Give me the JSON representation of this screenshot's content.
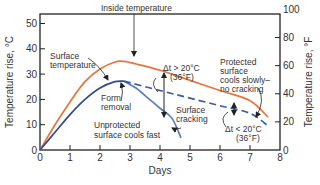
{
  "chart_data": {
    "type": "line",
    "title": "",
    "xlabel": "Days",
    "ylabel": "Temperature rise, °C",
    "ylabel_right": "Temperature rise, °F",
    "xlim": [
      0,
      8
    ],
    "ylim": [
      0,
      54
    ],
    "ylim_right": [
      0,
      100
    ],
    "grid": false,
    "x_ticks": [
      0,
      1,
      2,
      3,
      4,
      5,
      6,
      7,
      8
    ],
    "y_ticks": [
      0,
      10,
      20,
      30,
      40,
      50
    ],
    "y_ticks_right": [
      0,
      20,
      40,
      60,
      80,
      100
    ],
    "colors": {
      "inside": "#E8743B",
      "surface": "#2F4B92",
      "unprotected": "#5C7FBC",
      "protected": "#3A5BA5",
      "axis": "#222222",
      "text": "#333333"
    },
    "series": [
      {
        "name": "Inside temperature",
        "style": "solid",
        "x": [
          0,
          0.5,
          1,
          1.5,
          2,
          2.5,
          2.8,
          3.2,
          4,
          5,
          6,
          7,
          7.6
        ],
        "y": [
          0,
          10,
          19,
          27,
          32,
          34.8,
          35,
          34,
          31.5,
          27.5,
          23.5,
          19.5,
          13
        ]
      },
      {
        "name": "Surface temperature",
        "style": "solid",
        "x": [
          0,
          0.5,
          1,
          1.5,
          2,
          2.5,
          2.8
        ],
        "y": [
          0,
          7,
          14,
          20,
          24.5,
          27,
          27.2
        ]
      },
      {
        "name": "Unprotected surface cools fast",
        "style": "solid",
        "x": [
          2.8,
          3.2,
          3.6,
          4,
          4.4,
          4.7
        ],
        "y": [
          27.2,
          24.5,
          20.5,
          16.5,
          12.5,
          4.8
        ]
      },
      {
        "name": "Protected surface cools slowly—no cracking",
        "style": "dashed",
        "x": [
          2.8,
          4,
          5,
          6,
          7,
          7.6
        ],
        "y": [
          27.2,
          23.5,
          20.5,
          17.5,
          14.5,
          9.5
        ]
      }
    ],
    "annotations": [
      {
        "text": "Inside temperature",
        "x": 2.9,
        "y": 43
      },
      {
        "text": "Surface temperature",
        "x": 0.4,
        "y": 36
      },
      {
        "text": "Form removal",
        "x": 2.3,
        "y": 19
      },
      {
        "text": "Unprotected surface cools fast",
        "x": 1.8,
        "y": 8
      },
      {
        "text": "Δt > 20°C (36°F)",
        "x": 4.8,
        "y": 33
      },
      {
        "text": "Surface cracking",
        "x": 4.6,
        "y": 16
      },
      {
        "text": "Protected surface cools slowly– no cracking",
        "x": 6.0,
        "y": 35
      },
      {
        "text": "Δt < 20°C (36°F)",
        "x": 6.2,
        "y": 6
      }
    ]
  },
  "labels": {
    "inside_temperature": "Inside temperature",
    "surface_temperature_1": "Surface",
    "surface_temperature_2": "temperature",
    "form_removal_1": "Form",
    "form_removal_2": "removal",
    "unprotected_1": "Unprotected",
    "unprotected_2": "surface cools fast",
    "dt_gt_1": "Δt > 20°C",
    "dt_gt_2": "(36°F)",
    "surface_cracking_1": "Surface",
    "surface_cracking_2": "cracking",
    "protected_1": "Protected",
    "protected_2": "surface",
    "protected_3": "cools slowly–",
    "protected_4": "no cracking",
    "dt_lt_1": "Δt < 20°C",
    "dt_lt_2": "(36°F)"
  }
}
